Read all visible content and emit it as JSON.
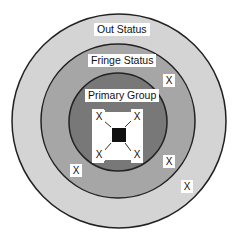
{
  "diagram": {
    "type": "concentric-circles",
    "rings": [
      {
        "name": "Out Status",
        "label": "Out Status",
        "color": "#d4d4d4"
      },
      {
        "name": "Fringe Status",
        "label": "Fringe Status",
        "color": "#a8a8a8"
      },
      {
        "name": "Primary Group",
        "label": "Primary Group",
        "color": "#7a7a7a"
      }
    ],
    "center_marker": {
      "color": "#111111"
    },
    "members": {
      "primary": [
        "X",
        "X",
        "X",
        "X"
      ],
      "fringe": [
        "X",
        "X",
        "X"
      ],
      "out": [
        "X"
      ]
    }
  }
}
